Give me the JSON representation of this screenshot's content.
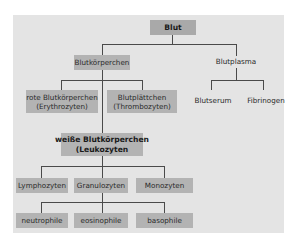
{
  "diagram": {
    "title": "Blut",
    "root": {
      "label": "Blut"
    },
    "level1": [
      {
        "label": "Blutkörperchen",
        "boxed": true
      },
      {
        "label": "Blutplasma",
        "boxed": false
      }
    ],
    "blutkoerperchen_children": [
      {
        "line1": "rote Blutkörperchen",
        "line2": "(Erythrozyten)"
      },
      {
        "line1": "Blutplättchen",
        "line2": "(Thrombozyten)"
      },
      {
        "line1": "weiße Blutkörperchen",
        "line2": "(Leukozyten"
      }
    ],
    "blutplasma_children": [
      {
        "label": "Blutserum"
      },
      {
        "label": "Fibrinogen"
      }
    ],
    "leukozyten_children": [
      {
        "label": "Lymphozyten"
      },
      {
        "label": "Granulozyten"
      },
      {
        "label": "Monozyten"
      }
    ],
    "granulozyten_children": [
      {
        "label": "neutrophile"
      },
      {
        "label": "eosinophile"
      },
      {
        "label": "basophile"
      }
    ],
    "colors": {
      "panel": "#e4e4e4",
      "box": "#b3b3b3",
      "line": "#4a4a4a",
      "text": "#2a2a2a"
    }
  }
}
